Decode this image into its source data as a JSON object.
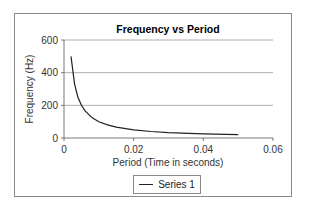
{
  "chart_data": {
    "type": "line",
    "title": "Frequency vs Period",
    "xlabel": "Period (Time in seconds)",
    "ylabel": "Frequency (Hz)",
    "xlim": [
      0,
      0.06
    ],
    "ylim": [
      0,
      600
    ],
    "x_ticks": [
      "0",
      "0.02",
      "0.04",
      "0.06"
    ],
    "y_ticks": [
      "0",
      "200",
      "400",
      "600"
    ],
    "grid": {
      "horizontal": true,
      "vertical": false
    },
    "legend_position": "bottom",
    "series": [
      {
        "name": "Series 1",
        "color": "#222222",
        "x": [
          0.002,
          0.003,
          0.004,
          0.005,
          0.006,
          0.008,
          0.01,
          0.0125,
          0.015,
          0.02,
          0.025,
          0.03,
          0.04,
          0.05
        ],
        "y": [
          500,
          333,
          250,
          200,
          167,
          125,
          100,
          80,
          67,
          50,
          40,
          33,
          25,
          20
        ]
      }
    ]
  },
  "legend": {
    "label": "Series 1"
  }
}
